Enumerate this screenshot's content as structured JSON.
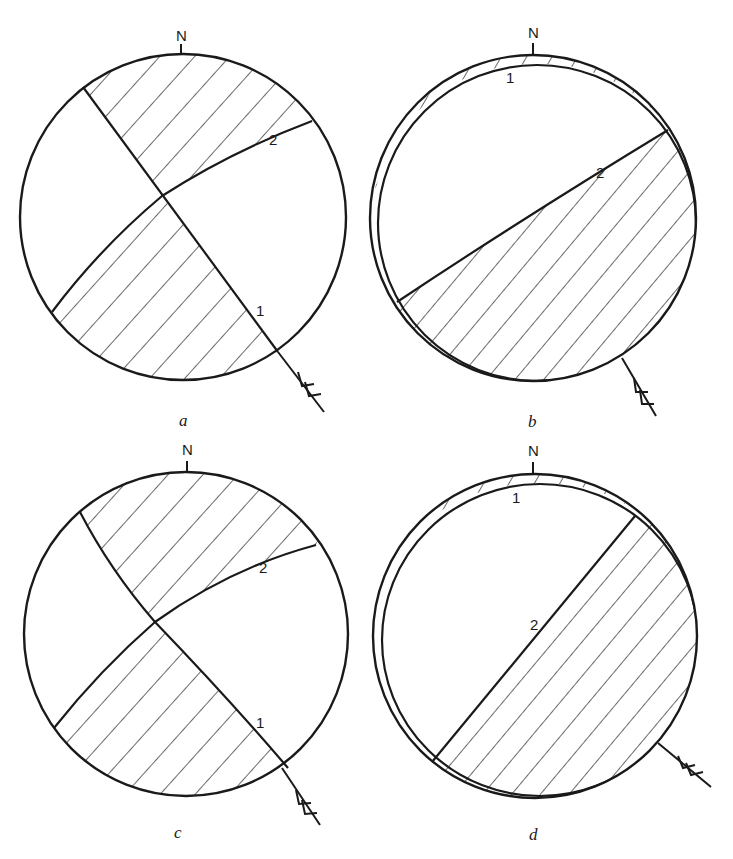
{
  "figure": {
    "background": "#ffffff",
    "ink": "#1a1a1a",
    "panels": [
      {
        "id": "a",
        "label": "a",
        "north_label": "N",
        "plane_labels": {
          "p1": "1",
          "p2": "2"
        },
        "center": [
          183,
          217
        ],
        "radius": 163,
        "label_pos": [
          184,
          426
        ],
        "description": "Two nodal planes intersecting inside the net; hatched N and S quadrants"
      },
      {
        "id": "b",
        "label": "b",
        "north_label": "N",
        "plane_labels": {
          "p1": "1",
          "p2": "2"
        },
        "center": [
          533,
          218
        ],
        "radius": 163,
        "label_pos": [
          533,
          427
        ],
        "description": "Plane 1 near-vertical rim crescent; plane 2 dividing; hatched S half"
      },
      {
        "id": "c",
        "label": "c",
        "north_label": "N",
        "plane_labels": {
          "p1": "1",
          "p2": "2"
        },
        "center": [
          186,
          634
        ],
        "radius": 162,
        "label_pos": [
          178,
          838
        ],
        "description": "Two nodal planes intersecting; hatched N and S quadrants"
      },
      {
        "id": "d",
        "label": "d",
        "north_label": "N",
        "plane_labels": {
          "p1": "1",
          "p2": "2"
        },
        "center": [
          535,
          636
        ],
        "radius": 162,
        "label_pos": [
          533,
          840
        ],
        "description": "Plane 1 rim crescent; plane 2 steep NE-SW; hatched SE half"
      }
    ]
  }
}
